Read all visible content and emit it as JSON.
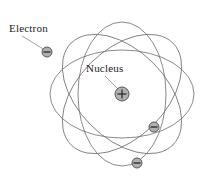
{
  "diagram": {
    "background_color": "#ffffff",
    "orbit_color": "#6b6b6b",
    "leader_color": "#8a8a8a",
    "particle_fill": "#b0b0b0",
    "particle_stroke": "#5a5a5a",
    "text_color": "#1a1a1a",
    "labels": {
      "electron": "Electron",
      "nucleus": "Nucleus"
    },
    "nucleus": {
      "symbol": "+",
      "center_x": 122,
      "center_y": 94,
      "radius": 7
    },
    "electrons": [
      {
        "symbol": "−",
        "center_x": 47,
        "center_y": 52,
        "radius": 5
      },
      {
        "symbol": "−",
        "center_x": 154,
        "center_y": 127,
        "radius": 5
      },
      {
        "symbol": "−",
        "center_x": 137,
        "center_y": 163,
        "radius": 5
      }
    ],
    "orbits": [
      {
        "center_x": 122,
        "center_y": 94,
        "rx": 72,
        "ry": 44,
        "rotation": 0
      },
      {
        "center_x": 122,
        "center_y": 94,
        "rx": 72,
        "ry": 44,
        "rotation": 45
      },
      {
        "center_x": 122,
        "center_y": 94,
        "rx": 72,
        "ry": 44,
        "rotation": 90
      },
      {
        "center_x": 122,
        "center_y": 94,
        "rx": 72,
        "ry": 44,
        "rotation": 135
      }
    ],
    "leader_lines": [
      {
        "name": "electron-leader",
        "x1": 22,
        "y1": 36,
        "x2": 45,
        "y2": 50
      },
      {
        "name": "nucleus-leader",
        "x1": 105,
        "y1": 76,
        "x2": 118,
        "y2": 89
      }
    ]
  }
}
